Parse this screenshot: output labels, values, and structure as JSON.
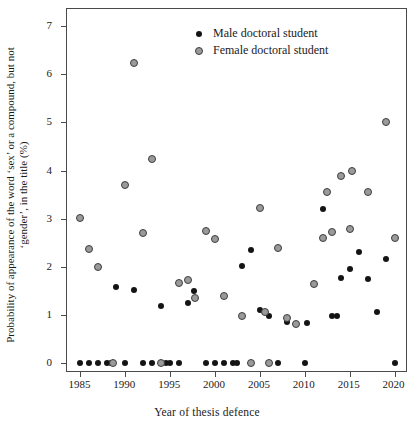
{
  "chart_data": {
    "type": "scatter",
    "title": "",
    "xlabel": "Year of thesis defence",
    "ylabel": "Probability of appearance of the word ‘sex’ or a compound, but not ‘gender’, in the title (%)",
    "xlim": [
      1983.5,
      2021.5
    ],
    "ylim": [
      -0.2,
      7.35
    ],
    "xticks": [
      1985,
      1990,
      1995,
      2000,
      2005,
      2010,
      2015,
      2020
    ],
    "xtick_labels": [
      "1985",
      "1990",
      "1995",
      "2000",
      "2005",
      "2010",
      "2015",
      "2020"
    ],
    "yticks": [
      0,
      1,
      2,
      3,
      4,
      5,
      6,
      7
    ],
    "ytick_labels": [
      "0",
      "1",
      "2",
      "3",
      "4",
      "5",
      "6",
      "7"
    ],
    "grid": false,
    "legend_position": "top-center",
    "series": [
      {
        "name": "Male doctoral student",
        "marker": "filled-circle",
        "color": "#141414",
        "points": [
          [
            1985,
            0.0
          ],
          [
            1986,
            0.0
          ],
          [
            1987,
            0.0
          ],
          [
            1988,
            0.0
          ],
          [
            1988.4,
            0.0
          ],
          [
            1989,
            1.58
          ],
          [
            1990,
            0.0
          ],
          [
            1991,
            1.52
          ],
          [
            1992,
            0.0
          ],
          [
            1993,
            0.0
          ],
          [
            1994,
            1.2
          ],
          [
            1994.5,
            0.0
          ],
          [
            1995,
            0.0
          ],
          [
            1996,
            0.0
          ],
          [
            1997,
            1.26
          ],
          [
            1997.6,
            1.5
          ],
          [
            1999,
            0.0
          ],
          [
            2000,
            0.0
          ],
          [
            2001,
            0.0
          ],
          [
            2002,
            0.0
          ],
          [
            2002.4,
            0.0
          ],
          [
            2003,
            2.02
          ],
          [
            2004,
            2.35
          ],
          [
            2005,
            1.11
          ],
          [
            2006,
            0.98
          ],
          [
            2007,
            0.0
          ],
          [
            2008,
            0.86
          ],
          [
            2010,
            0.0
          ],
          [
            2010.3,
            0.84
          ],
          [
            2012,
            3.2
          ],
          [
            2013,
            0.99
          ],
          [
            2013.6,
            0.99
          ],
          [
            2014,
            1.78
          ],
          [
            2015,
            1.95
          ],
          [
            2016,
            2.32
          ],
          [
            2017,
            1.75
          ],
          [
            2018,
            1.07
          ],
          [
            2019,
            2.17
          ],
          [
            2020,
            0.0
          ]
        ]
      },
      {
        "name": "Female doctoral student",
        "marker": "grey-circle",
        "color": "#9a9a9a",
        "points": [
          [
            1985,
            3.02
          ],
          [
            1986,
            2.38
          ],
          [
            1987,
            2.0
          ],
          [
            1988.6,
            0.0
          ],
          [
            1990,
            3.7
          ],
          [
            1991,
            6.23
          ],
          [
            1992,
            2.7
          ],
          [
            1993,
            4.24
          ],
          [
            1994,
            0.0
          ],
          [
            1996,
            1.67
          ],
          [
            1997,
            1.73
          ],
          [
            1997.8,
            1.35
          ],
          [
            1999,
            2.74
          ],
          [
            2000,
            2.57
          ],
          [
            2001,
            1.39
          ],
          [
            2003,
            0.99
          ],
          [
            2004,
            0.0
          ],
          [
            2005,
            3.22
          ],
          [
            2005.6,
            1.06
          ],
          [
            2006,
            0.0
          ],
          [
            2007,
            2.4
          ],
          [
            2008,
            0.94
          ],
          [
            2009,
            0.81
          ],
          [
            2011,
            1.65
          ],
          [
            2012,
            2.6
          ],
          [
            2012.5,
            3.55
          ],
          [
            2013,
            2.73
          ],
          [
            2014,
            3.88
          ],
          [
            2015,
            2.78
          ],
          [
            2015.3,
            4.0
          ],
          [
            2017,
            3.55
          ],
          [
            2019,
            5.0
          ],
          [
            2020,
            2.6
          ]
        ]
      }
    ]
  },
  "legend": {
    "items": [
      {
        "label": "Male doctoral student",
        "marker": "filled-circle"
      },
      {
        "label": "Female doctoral student",
        "marker": "grey-circle"
      }
    ]
  },
  "axes": {
    "x_title": "Year of thesis defence",
    "y_title": "Probability of appearance of the word ‘sex’ or a compound, but not ‘gender’, in the title (%)"
  }
}
